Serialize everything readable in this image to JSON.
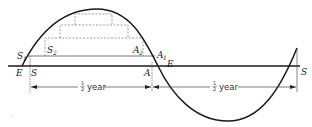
{
  "diagram": {
    "labels": {
      "E_left": "E",
      "S_left": "S",
      "A_mid": "A",
      "E_mid": "E",
      "S_right": "S",
      "S1": "S",
      "S1_sub": "1",
      "S2": "S",
      "S2_sub": "2",
      "A2": "A",
      "A2_sub": "2",
      "A1": "A",
      "A1_sub": "1"
    },
    "intervals": [
      {
        "fraction_num": "1",
        "fraction_den": "2",
        "unit": "year"
      },
      {
        "fraction_num": "1",
        "fraction_den": "2",
        "unit": "year"
      }
    ],
    "colors": {
      "curve": "#1a1a1a",
      "axis": "#1a1a1a",
      "dashed": "#777777",
      "text": "#222222"
    }
  }
}
